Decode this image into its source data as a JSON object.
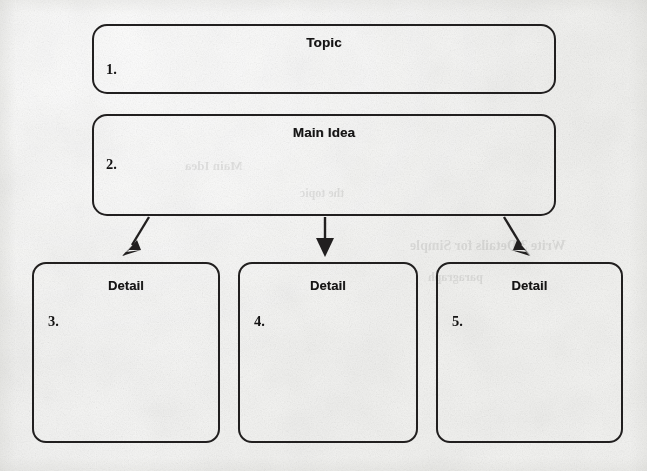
{
  "document": {
    "type": "graphic-organizer-worksheet",
    "medium": "scanned paper",
    "background_color": "#f6f6f5",
    "ink_color": "#211f1f"
  },
  "organizer": {
    "topic": {
      "header": "Topic",
      "number": "1.",
      "value": ""
    },
    "main_idea": {
      "header": "Main Idea",
      "number": "2.",
      "value": ""
    },
    "details": [
      {
        "header": "Detail",
        "number": "3.",
        "value": ""
      },
      {
        "header": "Detail",
        "number": "4.",
        "value": ""
      },
      {
        "header": "Detail",
        "number": "5.",
        "value": ""
      }
    ]
  },
  "connectors": [
    {
      "name": "arrow-main-to-detail-1",
      "direction": "down-left"
    },
    {
      "name": "arrow-main-to-detail-2",
      "direction": "down"
    },
    {
      "name": "arrow-main-to-detail-3",
      "direction": "down-right"
    }
  ],
  "bleed_through": [
    "Write 3 Details for Simple",
    "paragraph",
    "Main Idea",
    "the topic"
  ]
}
